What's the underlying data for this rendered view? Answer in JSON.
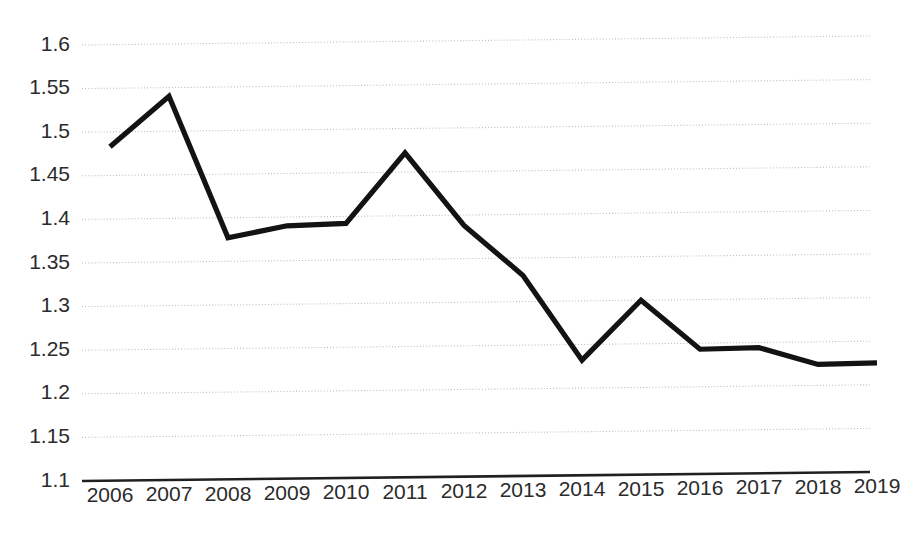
{
  "chart_data": {
    "type": "line",
    "title": "",
    "subtitle": "",
    "xlabel": "",
    "ylabel": "",
    "categories": [
      "2006",
      "2007",
      "2008",
      "2009",
      "2010",
      "2011",
      "2012",
      "2013",
      "2014",
      "2015",
      "2016",
      "2017",
      "2018",
      "2019"
    ],
    "x": [
      2006,
      2007,
      2008,
      2009,
      2010,
      2011,
      2012,
      2013,
      2014,
      2015,
      2016,
      2017,
      2018,
      2019
    ],
    "values": [
      1.483,
      1.54,
      1.377,
      1.39,
      1.392,
      1.472,
      1.388,
      1.33,
      1.232,
      1.3,
      1.243,
      1.244,
      1.224,
      1.225
    ],
    "series": [
      {
        "name": "series-1",
        "color": "#131313",
        "values": [
          1.483,
          1.54,
          1.377,
          1.39,
          1.392,
          1.472,
          1.388,
          1.33,
          1.232,
          1.3,
          1.243,
          1.244,
          1.224,
          1.225
        ]
      }
    ],
    "ylim": [
      1.1,
      1.6
    ],
    "xlim": [
      2006,
      2019
    ],
    "ytick_values": [
      1.1,
      1.15,
      1.2,
      1.25,
      1.3,
      1.35,
      1.4,
      1.45,
      1.5,
      1.55,
      1.6
    ],
    "ytick_labels": [
      "1.1",
      "1.15",
      "1.2",
      "1.25",
      "1.3",
      "1.35",
      "1.4",
      "1.45",
      "1.5",
      "1.55",
      "1.6"
    ],
    "xtick_labels": [
      "2006",
      "2007",
      "2008",
      "2009",
      "2010",
      "2011",
      "2012",
      "2013",
      "2014",
      "2015",
      "2016",
      "2017",
      "2018",
      "2019"
    ],
    "grid": true,
    "grid_axis": "y",
    "grid_style": "dotted",
    "legend": false,
    "legend_position": "none",
    "markers": false,
    "annotations": []
  },
  "colors": {
    "background": "#ffffff",
    "line": "#131313",
    "grid": "#bcbcbc",
    "axis": "#202020",
    "text": "#2b2b2b"
  },
  "geometry": {
    "plot_left": 82,
    "plot_right": 870,
    "plot_top": 45,
    "plot_bottom": 481,
    "first_point_x": 110,
    "point_spacing": 59,
    "tilt_px": -9,
    "xlabel_y": 487
  }
}
